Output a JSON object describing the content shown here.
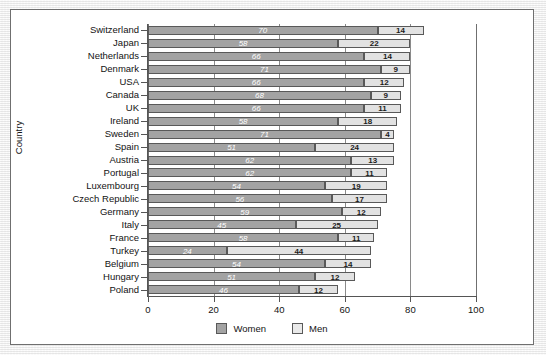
{
  "chart_data": {
    "type": "bar",
    "orientation": "horizontal",
    "stacked": true,
    "title": "",
    "xlabel": "",
    "ylabel": "Country",
    "xlim": [
      0,
      100
    ],
    "xticks": [
      0,
      20,
      40,
      60,
      80,
      100
    ],
    "xtick_labels": [
      "0",
      "20",
      "40",
      "60",
      "80",
      "100"
    ],
    "grid": true,
    "legend_position": "bottom",
    "categories": [
      "Switzerland",
      "Japan",
      "Netherlands",
      "Denmark",
      "USA",
      "Canada",
      "UK",
      "Ireland",
      "Sweden",
      "Spain",
      "Austria",
      "Portugal",
      "Luxembourg",
      "Czech Republic",
      "Germany",
      "Italy",
      "France",
      "Turkey",
      "Belgium",
      "Hungary",
      "Poland"
    ],
    "series": [
      {
        "name": "Women",
        "color": "#a3a3a3",
        "values": [
          70,
          58,
          66,
          71,
          66,
          68,
          66,
          58,
          71,
          51,
          62,
          62,
          54,
          56,
          59,
          45,
          58,
          24,
          54,
          51,
          46
        ]
      },
      {
        "name": "Men",
        "color": "#e2e2e2",
        "values": [
          14,
          22,
          14,
          9,
          12,
          9,
          11,
          18,
          4,
          24,
          13,
          11,
          19,
          17,
          12,
          25,
          11,
          44,
          14,
          12,
          12
        ]
      }
    ]
  },
  "legend": {
    "entries": [
      {
        "label": "Women",
        "swatch": "women"
      },
      {
        "label": "Men",
        "swatch": "men"
      }
    ]
  }
}
